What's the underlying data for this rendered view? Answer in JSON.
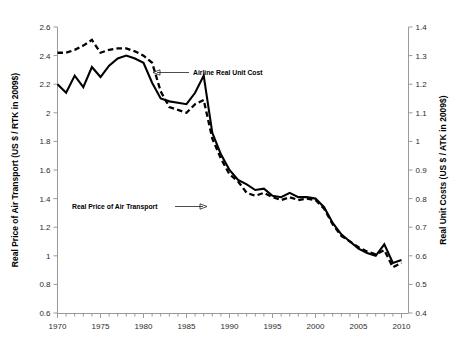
{
  "chart_data": {
    "type": "line",
    "title": "",
    "xlabel": "",
    "ylabel": "Real Price of Air Transport (US $ / RTK in 2009$)",
    "y2label": "Real Unit Costs (US $ / ATK in 2009$)",
    "xlim": [
      1969,
      2011
    ],
    "ylim": [
      0.6,
      2.6
    ],
    "y2lim": [
      0.4,
      1.4
    ],
    "grid": false,
    "legend_position": "none",
    "x_tick_labels": [
      "1970",
      "1975",
      "1980",
      "1985",
      "1990",
      "1995",
      "2000",
      "2005",
      "2010"
    ],
    "x_tick_values": [
      1970,
      1975,
      1980,
      1985,
      1990,
      1995,
      2000,
      2005,
      2010
    ],
    "x_minor_tick_step": 1,
    "y_tick_labels": [
      "0.6",
      "0.8",
      "1",
      "1.2",
      "1.4",
      "1.6",
      "1.8",
      "2",
      "2.2",
      "2.4",
      "2.6"
    ],
    "y_tick_values": [
      0.6,
      0.8,
      1.0,
      1.2,
      1.4,
      1.6,
      1.8,
      2.0,
      2.2,
      2.4,
      2.6
    ],
    "y2_tick_labels": [
      "0.4",
      "0.5",
      "0.6",
      "0.7",
      "0.8",
      "0.9",
      "1",
      "1.1",
      "1.2",
      "1.3",
      "1.4"
    ],
    "y2_tick_values": [
      0.4,
      0.5,
      0.6,
      0.7,
      0.8,
      0.9,
      1.0,
      1.1,
      1.2,
      1.3,
      1.4
    ],
    "x": [
      1970,
      1971,
      1972,
      1973,
      1974,
      1975,
      1976,
      1977,
      1978,
      1979,
      1980,
      1981,
      1982,
      1983,
      1984,
      1985,
      1986,
      1987,
      1988,
      1989,
      1990,
      1991,
      1992,
      1993,
      1994,
      1995,
      1996,
      1997,
      1998,
      1999,
      2000,
      2001,
      2002,
      2003,
      2004,
      2005,
      2006,
      2007,
      2008,
      2009,
      2010
    ],
    "series": [
      {
        "name": "Airline Real Unit Cost",
        "axis": "right",
        "style": "solid",
        "units": "US $ / ATK in 2009$",
        "values_left_axis": [
          2.2,
          2.14,
          2.26,
          2.18,
          2.32,
          2.25,
          2.33,
          2.38,
          2.4,
          2.38,
          2.35,
          2.21,
          2.1,
          2.08,
          2.07,
          2.06,
          2.14,
          2.26,
          1.86,
          1.71,
          1.6,
          1.53,
          1.5,
          1.46,
          1.47,
          1.42,
          1.41,
          1.44,
          1.41,
          1.41,
          1.4,
          1.34,
          1.23,
          1.15,
          1.1,
          1.05,
          1.02,
          1.0,
          1.08,
          0.95,
          0.97
        ],
        "values": [
          1.3,
          1.27,
          1.33,
          1.29,
          1.36,
          1.32,
          1.37,
          1.39,
          1.4,
          1.39,
          1.38,
          1.31,
          1.25,
          1.24,
          1.24,
          1.23,
          1.27,
          1.33,
          1.13,
          1.06,
          1.0,
          0.97,
          0.95,
          0.93,
          0.94,
          0.91,
          0.91,
          0.92,
          0.91,
          0.91,
          0.9,
          0.87,
          0.82,
          0.78,
          0.75,
          0.73,
          0.71,
          0.7,
          0.74,
          0.68,
          0.69
        ]
      },
      {
        "name": "Real Price of Air Transport",
        "axis": "left",
        "style": "dashed",
        "units": "US $ / RTK in 2009$",
        "values": [
          2.42,
          2.42,
          2.44,
          2.47,
          2.51,
          2.42,
          2.44,
          2.45,
          2.45,
          2.43,
          2.4,
          2.35,
          2.15,
          2.04,
          2.02,
          2.0,
          2.06,
          2.09,
          1.82,
          1.68,
          1.57,
          1.52,
          1.44,
          1.42,
          1.44,
          1.41,
          1.39,
          1.41,
          1.39,
          1.4,
          1.39,
          1.33,
          1.22,
          1.14,
          1.1,
          1.06,
          1.03,
          1.01,
          1.04,
          0.92,
          0.95
        ]
      }
    ],
    "annotations": [
      {
        "text": "Airline Real Unit Cost",
        "arrow": "left",
        "target_year": 1981,
        "target_value": 2.21
      },
      {
        "text": "Real Price of Air Transport",
        "arrow": "right",
        "target_year": 1988,
        "target_value": 1.82
      }
    ]
  }
}
